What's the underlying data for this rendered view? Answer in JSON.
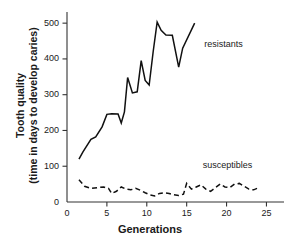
{
  "chart_data": {
    "type": "line",
    "title": "",
    "xlabel": "Generations",
    "ylabel_line1": "Tooth quality",
    "ylabel_line2": "(time in days to develop caries)",
    "xlim": [
      0,
      27.2
    ],
    "ylim": [
      0,
      520
    ],
    "grid": false,
    "legend_position": "inline-annotation",
    "xticks": [
      0,
      5,
      10,
      15,
      20,
      25
    ],
    "xtick_labels": [
      "0",
      "5",
      "10",
      "15",
      "20",
      "25"
    ],
    "yticks": [
      0,
      100,
      200,
      300,
      400,
      500
    ],
    "ytick_labels": [
      "0",
      "100",
      "200",
      "300",
      "400",
      "500"
    ],
    "series": [
      {
        "name": "resistants",
        "style": "solid",
        "color": "#111111",
        "label_x": 17.2,
        "label_y": 440,
        "x": [
          1.5,
          2.0,
          3.0,
          3.6,
          4.4,
          5.0,
          5.6,
          6.4,
          6.8,
          7.2,
          7.6,
          8.2,
          8.8,
          9.3,
          9.8,
          10.3,
          10.8,
          11.3,
          11.8,
          12.4,
          13.2,
          14.0,
          14.5,
          16.0
        ],
        "y": [
          120,
          140,
          175,
          182,
          210,
          245,
          247,
          246,
          221,
          252,
          348,
          305,
          308,
          395,
          340,
          327,
          420,
          503,
          480,
          467,
          466,
          377,
          430,
          500
        ]
      },
      {
        "name": "susceptibles",
        "style": "dashed",
        "color": "#111111",
        "label_x": 17.0,
        "label_y": 100,
        "x": [
          1.5,
          2.2,
          3.0,
          3.8,
          4.6,
          5.2,
          5.6,
          6.2,
          6.8,
          7.4,
          8.0,
          8.6,
          9.2,
          9.8,
          10.4,
          11.0,
          11.6,
          12.2,
          12.8,
          13.4,
          14.0,
          14.6,
          15.0,
          15.6,
          16.2,
          16.8,
          17.4,
          18.0,
          18.6,
          19.2,
          19.8,
          20.4,
          21.0,
          21.6,
          22.2,
          22.8,
          23.4,
          24.0
        ],
        "y": [
          62,
          44,
          38,
          40,
          42,
          38,
          24,
          30,
          42,
          36,
          34,
          38,
          33,
          26,
          20,
          17,
          24,
          26,
          24,
          20,
          18,
          22,
          52,
          36,
          42,
          48,
          36,
          30,
          40,
          50,
          42,
          40,
          50,
          52,
          44,
          36,
          34,
          40
        ]
      }
    ]
  },
  "annotations": {
    "resistants_label": "resistants",
    "susceptibles_label": "susceptibles"
  },
  "axes": {
    "x_title": "Generations",
    "y_title_line1": "Tooth quality",
    "y_title_line2": "(time in days to develop caries)"
  }
}
